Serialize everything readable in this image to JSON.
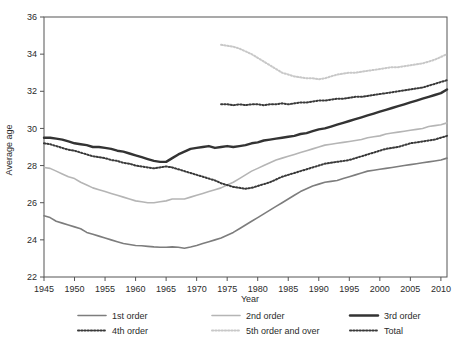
{
  "chart_data": {
    "type": "line",
    "title": "",
    "xlabel": "Year",
    "ylabel": "Average age",
    "xlim": [
      1945,
      2011
    ],
    "ylim": [
      22,
      36
    ],
    "xticks": [
      1945,
      1950,
      1955,
      1960,
      1965,
      1970,
      1975,
      1980,
      1985,
      1990,
      1995,
      2000,
      2005,
      2010
    ],
    "yticks": [
      22,
      24,
      26,
      28,
      30,
      32,
      34,
      36
    ],
    "grid": false,
    "legend_position": "bottom",
    "series": [
      {
        "name": "1st order",
        "style": "solid",
        "width": 1.6,
        "color": "#7d7d7d",
        "x": [
          1945,
          1946,
          1947,
          1948,
          1949,
          1950,
          1951,
          1952,
          1953,
          1954,
          1955,
          1956,
          1957,
          1958,
          1959,
          1960,
          1961,
          1962,
          1963,
          1964,
          1965,
          1966,
          1967,
          1968,
          1969,
          1970,
          1971,
          1972,
          1973,
          1974,
          1975,
          1976,
          1977,
          1978,
          1979,
          1980,
          1981,
          1982,
          1983,
          1984,
          1985,
          1986,
          1987,
          1988,
          1989,
          1990,
          1991,
          1992,
          1993,
          1994,
          1995,
          1996,
          1997,
          1998,
          1999,
          2000,
          2001,
          2002,
          2003,
          2004,
          2005,
          2006,
          2007,
          2008,
          2009,
          2010,
          2011
        ],
        "y": [
          25.3,
          25.2,
          25.0,
          24.9,
          24.8,
          24.7,
          24.6,
          24.4,
          24.3,
          24.2,
          24.1,
          24.0,
          23.9,
          23.8,
          23.75,
          23.7,
          23.68,
          23.65,
          23.62,
          23.6,
          23.6,
          23.62,
          23.6,
          23.55,
          23.62,
          23.7,
          23.8,
          23.9,
          24.0,
          24.1,
          24.25,
          24.4,
          24.6,
          24.8,
          25.0,
          25.2,
          25.4,
          25.6,
          25.8,
          26.0,
          26.2,
          26.4,
          26.6,
          26.75,
          26.9,
          27.0,
          27.1,
          27.15,
          27.2,
          27.3,
          27.4,
          27.5,
          27.6,
          27.7,
          27.75,
          27.8,
          27.85,
          27.9,
          27.95,
          28.0,
          28.05,
          28.1,
          28.15,
          28.2,
          28.25,
          28.3,
          28.4
        ]
      },
      {
        "name": "2nd order",
        "style": "solid",
        "width": 1.6,
        "color": "#b5b5b5",
        "x": [
          1945,
          1946,
          1947,
          1948,
          1949,
          1950,
          1951,
          1952,
          1953,
          1954,
          1955,
          1956,
          1957,
          1958,
          1959,
          1960,
          1961,
          1962,
          1963,
          1964,
          1965,
          1966,
          1967,
          1968,
          1969,
          1970,
          1971,
          1972,
          1973,
          1974,
          1975,
          1976,
          1977,
          1978,
          1979,
          1980,
          1981,
          1982,
          1983,
          1984,
          1985,
          1986,
          1987,
          1988,
          1989,
          1990,
          1991,
          1992,
          1993,
          1994,
          1995,
          1996,
          1997,
          1998,
          1999,
          2000,
          2001,
          2002,
          2003,
          2004,
          2005,
          2006,
          2007,
          2008,
          2009,
          2010,
          2011
        ],
        "y": [
          27.9,
          27.85,
          27.7,
          27.55,
          27.4,
          27.3,
          27.1,
          26.95,
          26.8,
          26.7,
          26.6,
          26.5,
          26.4,
          26.3,
          26.2,
          26.1,
          26.05,
          26.0,
          26.0,
          26.05,
          26.1,
          26.2,
          26.2,
          26.2,
          26.3,
          26.4,
          26.5,
          26.6,
          26.7,
          26.8,
          26.95,
          27.1,
          27.3,
          27.5,
          27.7,
          27.85,
          28.0,
          28.15,
          28.3,
          28.4,
          28.5,
          28.6,
          28.7,
          28.8,
          28.9,
          29.0,
          29.1,
          29.15,
          29.2,
          29.25,
          29.3,
          29.35,
          29.4,
          29.5,
          29.55,
          29.6,
          29.7,
          29.75,
          29.8,
          29.85,
          29.9,
          29.95,
          30.0,
          30.1,
          30.15,
          30.2,
          30.3
        ]
      },
      {
        "name": "3rd order",
        "style": "solid",
        "width": 2.4,
        "color": "#333333",
        "x": [
          1945,
          1946,
          1947,
          1948,
          1949,
          1950,
          1951,
          1952,
          1953,
          1954,
          1955,
          1956,
          1957,
          1958,
          1959,
          1960,
          1961,
          1962,
          1963,
          1964,
          1965,
          1966,
          1967,
          1968,
          1969,
          1970,
          1971,
          1972,
          1973,
          1974,
          1975,
          1976,
          1977,
          1978,
          1979,
          1980,
          1981,
          1982,
          1983,
          1984,
          1985,
          1986,
          1987,
          1988,
          1989,
          1990,
          1991,
          1992,
          1993,
          1994,
          1995,
          1996,
          1997,
          1998,
          1999,
          2000,
          2001,
          2002,
          2003,
          2004,
          2005,
          2006,
          2007,
          2008,
          2009,
          2010,
          2011
        ],
        "y": [
          29.5,
          29.5,
          29.45,
          29.4,
          29.3,
          29.2,
          29.15,
          29.1,
          29.0,
          29.0,
          28.95,
          28.9,
          28.8,
          28.75,
          28.65,
          28.55,
          28.45,
          28.35,
          28.25,
          28.2,
          28.2,
          28.4,
          28.6,
          28.75,
          28.9,
          28.95,
          29.0,
          29.05,
          28.95,
          29.0,
          29.05,
          29.0,
          29.05,
          29.1,
          29.2,
          29.25,
          29.35,
          29.4,
          29.45,
          29.5,
          29.55,
          29.6,
          29.7,
          29.75,
          29.85,
          29.95,
          30.0,
          30.1,
          30.2,
          30.3,
          30.4,
          30.5,
          30.6,
          30.7,
          30.8,
          30.9,
          31.0,
          31.1,
          31.2,
          31.3,
          31.4,
          31.5,
          31.6,
          31.7,
          31.8,
          31.9,
          32.1
        ]
      },
      {
        "name": "4th order",
        "style": "dotted",
        "width": 2.0,
        "color": "#3a3a3a",
        "x": [
          1974,
          1975,
          1976,
          1977,
          1978,
          1979,
          1980,
          1981,
          1982,
          1983,
          1984,
          1985,
          1986,
          1987,
          1988,
          1989,
          1990,
          1991,
          1992,
          1993,
          1994,
          1995,
          1996,
          1997,
          1998,
          1999,
          2000,
          2001,
          2002,
          2003,
          2004,
          2005,
          2006,
          2007,
          2008,
          2009,
          2010,
          2011
        ],
        "y": [
          31.3,
          31.3,
          31.25,
          31.3,
          31.25,
          31.3,
          31.3,
          31.25,
          31.3,
          31.3,
          31.35,
          31.3,
          31.35,
          31.4,
          31.4,
          31.45,
          31.5,
          31.5,
          31.55,
          31.6,
          31.6,
          31.65,
          31.7,
          31.7,
          31.75,
          31.8,
          31.85,
          31.9,
          31.95,
          32.0,
          32.05,
          32.1,
          32.15,
          32.2,
          32.3,
          32.4,
          32.5,
          32.6
        ]
      },
      {
        "name": "5th order and over",
        "style": "dotted",
        "width": 2.0,
        "color": "#c8c8c8",
        "x": [
          1974,
          1975,
          1976,
          1977,
          1978,
          1979,
          1980,
          1981,
          1982,
          1983,
          1984,
          1985,
          1986,
          1987,
          1988,
          1989,
          1990,
          1991,
          1992,
          1993,
          1994,
          1995,
          1996,
          1997,
          1998,
          1999,
          2000,
          2001,
          2002,
          2003,
          2004,
          2005,
          2006,
          2007,
          2008,
          2009,
          2010,
          2011
        ],
        "y": [
          34.5,
          34.45,
          34.4,
          34.3,
          34.15,
          34.0,
          33.8,
          33.6,
          33.4,
          33.2,
          33.0,
          32.9,
          32.8,
          32.75,
          32.7,
          32.7,
          32.65,
          32.7,
          32.8,
          32.9,
          32.95,
          33.0,
          33.0,
          33.05,
          33.1,
          33.15,
          33.2,
          33.25,
          33.3,
          33.3,
          33.35,
          33.4,
          33.45,
          33.5,
          33.6,
          33.7,
          33.85,
          34.0
        ]
      },
      {
        "name": "Total",
        "style": "dotted",
        "width": 2.0,
        "color": "#3a3a3a",
        "x": [
          1945,
          1946,
          1947,
          1948,
          1949,
          1950,
          1951,
          1952,
          1953,
          1954,
          1955,
          1956,
          1957,
          1958,
          1959,
          1960,
          1961,
          1962,
          1963,
          1964,
          1965,
          1966,
          1967,
          1968,
          1969,
          1970,
          1971,
          1972,
          1973,
          1974,
          1975,
          1976,
          1977,
          1978,
          1979,
          1980,
          1981,
          1982,
          1983,
          1984,
          1985,
          1986,
          1987,
          1988,
          1989,
          1990,
          1991,
          1992,
          1993,
          1994,
          1995,
          1996,
          1997,
          1998,
          1999,
          2000,
          2001,
          2002,
          2003,
          2004,
          2005,
          2006,
          2007,
          2008,
          2009,
          2010,
          2011
        ],
        "y": [
          29.2,
          29.15,
          29.05,
          28.95,
          28.85,
          28.8,
          28.7,
          28.6,
          28.5,
          28.45,
          28.4,
          28.3,
          28.25,
          28.15,
          28.1,
          28.0,
          27.95,
          27.9,
          27.85,
          27.9,
          27.95,
          27.9,
          27.8,
          27.7,
          27.6,
          27.5,
          27.4,
          27.3,
          27.2,
          27.05,
          26.95,
          26.85,
          26.8,
          26.75,
          26.8,
          26.9,
          27.0,
          27.1,
          27.25,
          27.4,
          27.5,
          27.6,
          27.7,
          27.8,
          27.9,
          28.0,
          28.1,
          28.15,
          28.2,
          28.25,
          28.3,
          28.4,
          28.5,
          28.6,
          28.7,
          28.8,
          28.9,
          28.95,
          29.0,
          29.1,
          29.2,
          29.25,
          29.3,
          29.35,
          29.4,
          29.5,
          29.6
        ]
      }
    ]
  },
  "legend": {
    "items": [
      {
        "label": "1st order"
      },
      {
        "label": "2nd order"
      },
      {
        "label": "3rd order"
      },
      {
        "label": "4th order"
      },
      {
        "label": "5th order and over"
      },
      {
        "label": "Total"
      }
    ]
  },
  "axes": {
    "x_title": "Year",
    "y_title": "Average age"
  }
}
